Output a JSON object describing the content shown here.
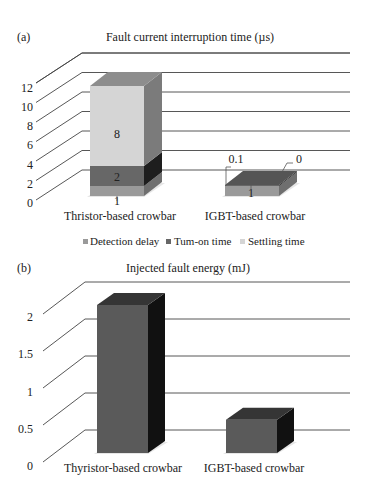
{
  "chart_data": [
    {
      "panel_label": "(a)",
      "type": "bar",
      "stacked": true,
      "three_d": true,
      "title": "Fault current interruption time (µs)",
      "categories": [
        "Thristor-based crowbar",
        "IGBT-based crowbar"
      ],
      "series": [
        {
          "name": "Detection delay",
          "values": [
            1,
            1
          ],
          "color": "#9a9a9a",
          "side": "#6f6f6f",
          "top": "#8a8a8a"
        },
        {
          "name": "Tum-on time",
          "values": [
            2,
            0.1
          ],
          "color": "#676767",
          "side": "#1e1e1e",
          "top": "#555555"
        },
        {
          "name": "Settling time",
          "values": [
            8,
            0
          ],
          "color": "#d5d5d5",
          "side": "#7b7b7b",
          "top": "#8d8d8d"
        }
      ],
      "data_labels": {
        "thyristor": [
          "1",
          "2",
          "8"
        ],
        "igbt": [
          "1",
          "0.1",
          "0"
        ]
      },
      "ylabel": "",
      "xlabel": "",
      "ylim": [
        0,
        12
      ],
      "yticks": [
        "0",
        "2",
        "4",
        "6",
        "8",
        "10",
        "12"
      ],
      "grid": true,
      "legend_position": "bottom",
      "legend": [
        "Detection delay",
        "Tum-on time",
        "Settling time"
      ]
    },
    {
      "panel_label": "(b)",
      "type": "bar",
      "three_d": true,
      "title": "Injected fault energy (mJ)",
      "categories": [
        "Thyristor-based crowbar",
        "IGBT-based crowbar"
      ],
      "values": [
        2.0,
        0.45
      ],
      "color": "#5a5a5a",
      "side": "#111111",
      "top": "#353535",
      "ylabel": "",
      "xlabel": "",
      "ylim": [
        0,
        2
      ],
      "yticks": [
        "0",
        "0.5",
        "1",
        "1.5",
        "2"
      ],
      "grid": true,
      "legend_position": "none"
    }
  ]
}
